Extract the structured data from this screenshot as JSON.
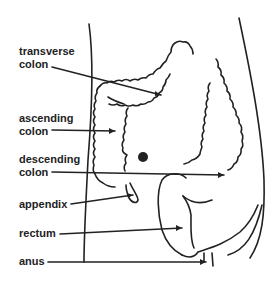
{
  "labels": {
    "transverse_1": "transverse",
    "transverse_2": "colon",
    "ascending_1": "ascending",
    "ascending_2": "colon",
    "descending_1": "descending",
    "descending_2": "colon",
    "appendix": "appendix",
    "rectum": "rectum",
    "anus": "anus"
  },
  "colors": {
    "ink": "#222222",
    "background": "#ffffff"
  }
}
